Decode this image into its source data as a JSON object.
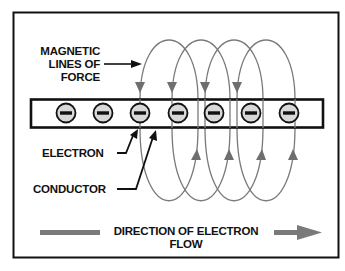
{
  "figure": {
    "labels": {
      "magnetic_lines": [
        "MAGNETIC",
        "LINES OF",
        "FORCE"
      ],
      "electron": "ELECTRON",
      "conductor": "CONDUCTOR",
      "direction": [
        "DIRECTION OF ELECTRON",
        "FLOW"
      ]
    },
    "electron_symbol": "−",
    "electron_count": 7,
    "field_loop_count": 4,
    "colors": {
      "frame": "#111111",
      "field_lines": "#7a7a7a",
      "electron_fill": "#d8d8d8",
      "flow_arrow": "#7a7a7a",
      "background": "#ffffff"
    }
  }
}
